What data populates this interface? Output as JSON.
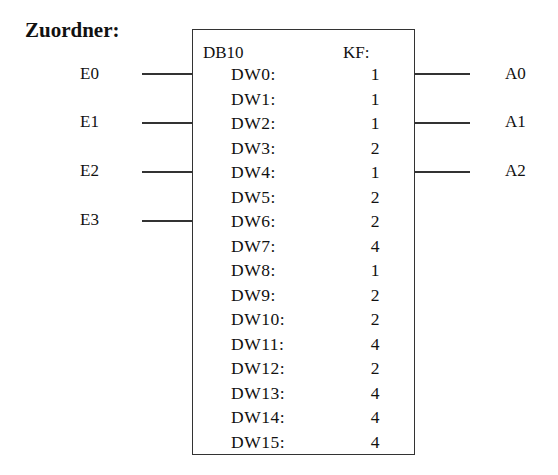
{
  "title": "Zuordner:",
  "block": {
    "name": "DB10",
    "format": "KF:",
    "words": [
      {
        "label": "DW0:",
        "value": "1"
      },
      {
        "label": "DW1:",
        "value": "1"
      },
      {
        "label": "DW2:",
        "value": "1"
      },
      {
        "label": "DW3:",
        "value": "2"
      },
      {
        "label": "DW4:",
        "value": "1"
      },
      {
        "label": "DW5:",
        "value": "2"
      },
      {
        "label": "DW6:",
        "value": "2"
      },
      {
        "label": "DW7:",
        "value": "4"
      },
      {
        "label": "DW8:",
        "value": "1"
      },
      {
        "label": "DW9:",
        "value": "2"
      },
      {
        "label": "DW10:",
        "value": "2"
      },
      {
        "label": "DW11:",
        "value": "4"
      },
      {
        "label": "DW12:",
        "value": "2"
      },
      {
        "label": "DW13:",
        "value": "4"
      },
      {
        "label": "DW14:",
        "value": "4"
      },
      {
        "label": "DW15:",
        "value": "4"
      }
    ]
  },
  "inputs": [
    "E0",
    "E1",
    "E2",
    "E3"
  ],
  "outputs": [
    "A0",
    "A1",
    "A2"
  ]
}
